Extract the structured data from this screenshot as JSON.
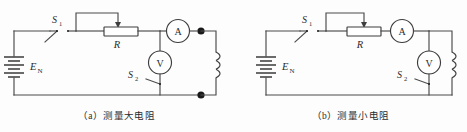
{
  "figure": {
    "background_color": "#fdfdfd",
    "line_color": "#4a4a4a"
  },
  "panels": [
    {
      "id": "a",
      "caption": "（a）测量大电阻",
      "labels": {
        "switch_1": "S",
        "switch_1_sub": "1",
        "switch_2": "S",
        "switch_2_sub": "2",
        "source": "E",
        "source_sub": "N",
        "rheostat": "R",
        "ammeter": "A",
        "voltmeter": "V"
      },
      "components": [
        {
          "name": "battery",
          "label": "E_N",
          "type": "multi-cell-battery"
        },
        {
          "name": "switch-s1",
          "label": "S₁",
          "type": "spst-switch",
          "state": "open"
        },
        {
          "name": "rheostat-r",
          "label": "R",
          "type": "potentiometer"
        },
        {
          "name": "ammeter",
          "label": "A",
          "type": "meter-circle"
        },
        {
          "name": "voltmeter",
          "label": "V",
          "type": "meter-circle"
        },
        {
          "name": "switch-s2",
          "label": "S₂",
          "type": "spst-switch",
          "state": "open"
        },
        {
          "name": "coil-under-test",
          "label": "",
          "type": "coil"
        },
        {
          "name": "terminal-top",
          "label": "",
          "type": "node-dot"
        },
        {
          "name": "terminal-bottom",
          "label": "",
          "type": "node-dot"
        }
      ]
    },
    {
      "id": "b",
      "caption": "（b）测量小电阻",
      "labels": {
        "switch_1": "S",
        "switch_1_sub": "1",
        "switch_2": "S",
        "switch_2_sub": "2",
        "source": "E",
        "source_sub": "N",
        "rheostat": "R",
        "ammeter": "A",
        "voltmeter": "V"
      },
      "components": [
        {
          "name": "battery",
          "label": "E_N",
          "type": "multi-cell-battery"
        },
        {
          "name": "switch-s1",
          "label": "S₁",
          "type": "spst-switch",
          "state": "open"
        },
        {
          "name": "rheostat-r",
          "label": "R",
          "type": "potentiometer"
        },
        {
          "name": "ammeter",
          "label": "A",
          "type": "meter-circle"
        },
        {
          "name": "voltmeter",
          "label": "V",
          "type": "meter-circle"
        },
        {
          "name": "switch-s2",
          "label": "S₂",
          "type": "spst-switch",
          "state": "open"
        },
        {
          "name": "coil-under-test",
          "label": "",
          "type": "coil"
        }
      ]
    }
  ]
}
